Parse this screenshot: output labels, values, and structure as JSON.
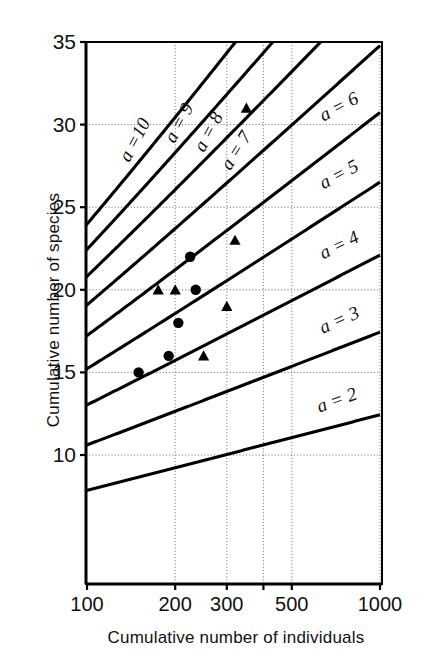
{
  "figure": {
    "x_axis_title": "Cumulative number of individuals",
    "y_axis_title": "Cumulative number of species"
  },
  "chart_data": {
    "type": "line",
    "title": "",
    "subtitle": "",
    "xlabel": "Cumulative number of individuals",
    "ylabel": "Cumulative number of species",
    "x_scale": "log",
    "y_scale": "linear",
    "xlim": [
      85,
      1000
    ],
    "ylim": [
      7.1,
      35
    ],
    "xticks": [
      100,
      200,
      300,
      400,
      500,
      1000
    ],
    "xticklabels": [
      "100",
      "200",
      "300",
      "",
      "500",
      "1000"
    ],
    "yticks": [
      10,
      15,
      20,
      25,
      30,
      35
    ],
    "yticklabels": [
      "10",
      "15",
      "20",
      "25",
      "30",
      "35"
    ],
    "grid": true,
    "grid_style": "dashed-thin",
    "legend": "inline-curve-labels",
    "annotations": [
      {
        "text": "a =10",
        "curve": "alpha-10",
        "position": "top"
      },
      {
        "text": "a = 9",
        "curve": "alpha-9",
        "position": "top"
      },
      {
        "text": "a = 8",
        "curve": "alpha-8",
        "position": "top"
      },
      {
        "text": "a = 7",
        "curve": "alpha-7",
        "position": "top"
      },
      {
        "text": "a = 6",
        "curve": "alpha-6",
        "position": "right"
      },
      {
        "text": "a = 5",
        "curve": "alpha-5",
        "position": "right"
      },
      {
        "text": "a = 4",
        "curve": "alpha-4",
        "position": "right"
      },
      {
        "text": "a = 3",
        "curve": "alpha-3",
        "position": "right"
      },
      {
        "text": "a = 2",
        "curve": "alpha-2",
        "position": "right"
      }
    ],
    "curve_model": "S = alpha * ln(1 + N/alpha)",
    "series": [
      {
        "name": "alpha-10",
        "alpha": 10,
        "label": "a =10",
        "kind": "fisher-alpha-curve"
      },
      {
        "name": "alpha-9",
        "alpha": 9,
        "label": "a = 9",
        "kind": "fisher-alpha-curve"
      },
      {
        "name": "alpha-8",
        "alpha": 8,
        "label": "a = 8",
        "kind": "fisher-alpha-curve"
      },
      {
        "name": "alpha-7",
        "alpha": 7,
        "label": "a = 7",
        "kind": "fisher-alpha-curve"
      },
      {
        "name": "alpha-6",
        "alpha": 6,
        "label": "a = 6",
        "kind": "fisher-alpha-curve"
      },
      {
        "name": "alpha-5",
        "alpha": 5,
        "label": "a = 5",
        "kind": "fisher-alpha-curve"
      },
      {
        "name": "alpha-4",
        "alpha": 4,
        "label": "a = 4",
        "kind": "fisher-alpha-curve"
      },
      {
        "name": "alpha-3",
        "alpha": 3,
        "label": "a = 3",
        "kind": "fisher-alpha-curve"
      },
      {
        "name": "alpha-2",
        "alpha": 2,
        "label": "a = 2",
        "kind": "fisher-alpha-curve"
      }
    ],
    "scatter_series": [
      {
        "name": "sample-circles",
        "marker": "circle",
        "color": "#000000",
        "points": [
          {
            "x": 95,
            "y": 10
          },
          {
            "x": 150,
            "y": 15
          },
          {
            "x": 190,
            "y": 16
          },
          {
            "x": 205,
            "y": 18
          },
          {
            "x": 235,
            "y": 20
          },
          {
            "x": 225,
            "y": 22
          }
        ]
      },
      {
        "name": "sample-triangles",
        "marker": "triangle",
        "color": "#000000",
        "points": [
          {
            "x": 250,
            "y": 16
          },
          {
            "x": 300,
            "y": 19
          },
          {
            "x": 175,
            "y": 20
          },
          {
            "x": 200,
            "y": 20
          },
          {
            "x": 320,
            "y": 23
          },
          {
            "x": 350,
            "y": 31
          }
        ]
      }
    ]
  }
}
